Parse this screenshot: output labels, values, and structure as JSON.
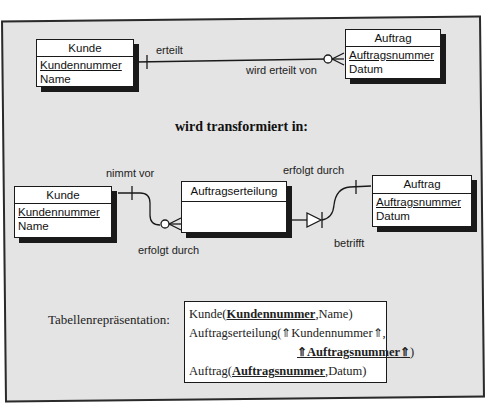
{
  "top_diagram": {
    "entity_left": {
      "name": "Kunde",
      "attributes": [
        {
          "name": "Kundennummer",
          "pk": true
        },
        {
          "name": "Name",
          "pk": false
        }
      ]
    },
    "entity_right": {
      "name": "Auftrag",
      "attributes": [
        {
          "name": "Auftragsnummer",
          "pk": true
        },
        {
          "name": "Datum",
          "pk": false
        }
      ]
    },
    "relation_forward": "erteilt",
    "relation_backward": "wird erteilt von"
  },
  "heading": "wird transformiert in:",
  "bottom_diagram": {
    "entity_left": {
      "name": "Kunde",
      "attributes": [
        {
          "name": "Kundennummer",
          "pk": true
        },
        {
          "name": "Name",
          "pk": false
        }
      ]
    },
    "entity_middle": {
      "name": "Auftragserteilung",
      "attributes": []
    },
    "entity_right": {
      "name": "Auftrag",
      "attributes": [
        {
          "name": "Auftragsnummer",
          "pk": true
        },
        {
          "name": "Datum",
          "pk": false
        }
      ]
    },
    "label_nimmt_vor": "nimmt vor",
    "label_erfolgt_durch_left": "erfolgt durch",
    "label_erfolgt_durch_right": "erfolgt durch",
    "label_betrifft": "betrifft"
  },
  "table_representation": {
    "label": "Tabellenrepräsentation:",
    "rows": {
      "kunde_prefix": "Kunde(",
      "kunde_pk": "Kundennummer",
      "kunde_suffix": ",Name)",
      "ae_prefix": "Auftragserteilung(",
      "fk_arrow": "⇑",
      "ae_attr1": "Kundennummer",
      "ae_sep": ",",
      "ae_attr2": "Auftragsnummer",
      "ae_close": ")",
      "auftrag_prefix": "Auftrag(",
      "auftrag_pk": "Auftragsnummer",
      "auftrag_suffix": ",Datum)"
    }
  },
  "colors": {
    "background": "#e4e4e4",
    "frame": "#2a2a2a",
    "box": "#ffffff",
    "shadow": "#1a1a1a"
  }
}
